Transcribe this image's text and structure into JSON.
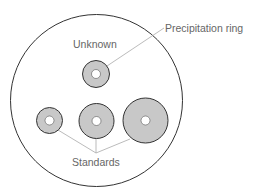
{
  "diagram": {
    "type": "radial immunodiffusion plate",
    "plate": {
      "cx": 96.5,
      "cy": 100.5,
      "r": 86
    },
    "colors": {
      "plate_stroke": "#333333",
      "ring_fill": "#c8c8c8",
      "ring_stroke": "#333333",
      "well_fill": "#ffffff",
      "leader_line": "#aaaaaa",
      "label_text": "#666666"
    },
    "labels": {
      "precipitation_ring": "Precipitation ring",
      "unknown": "Unknown",
      "standards": "Standards"
    },
    "unknown_ring": {
      "cx": 96,
      "cy": 74,
      "r": 13.5,
      "well_r": 4.5
    },
    "standard_rings": [
      {
        "name": "standard-small",
        "cx": 49.5,
        "cy": 120.5,
        "r": 13,
        "well_r": 4.5
      },
      {
        "name": "standard-medium",
        "cx": 96.5,
        "cy": 121,
        "r": 17.5,
        "well_r": 4.5
      },
      {
        "name": "standard-large",
        "cx": 145.5,
        "cy": 120.5,
        "r": 22.5,
        "well_r": 4.5
      }
    ]
  }
}
